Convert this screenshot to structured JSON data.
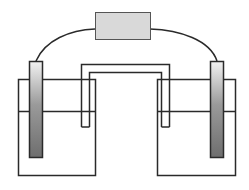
{
  "diagram": {
    "title": "",
    "type": "electrochemical-cell",
    "colors": {
      "stroke": "#2a2a2a",
      "meter_fill": "#d9d9d9",
      "electrode_light": "#efefef",
      "electrode_dark": "#6e6e6e",
      "background": "#ffffff"
    },
    "components": [
      {
        "id": "meter",
        "label": ""
      },
      {
        "id": "left-electrode",
        "label": ""
      },
      {
        "id": "right-electrode",
        "label": ""
      },
      {
        "id": "left-beaker",
        "label": ""
      },
      {
        "id": "right-beaker",
        "label": ""
      },
      {
        "id": "salt-bridge",
        "label": ""
      },
      {
        "id": "wire",
        "label": ""
      }
    ]
  }
}
